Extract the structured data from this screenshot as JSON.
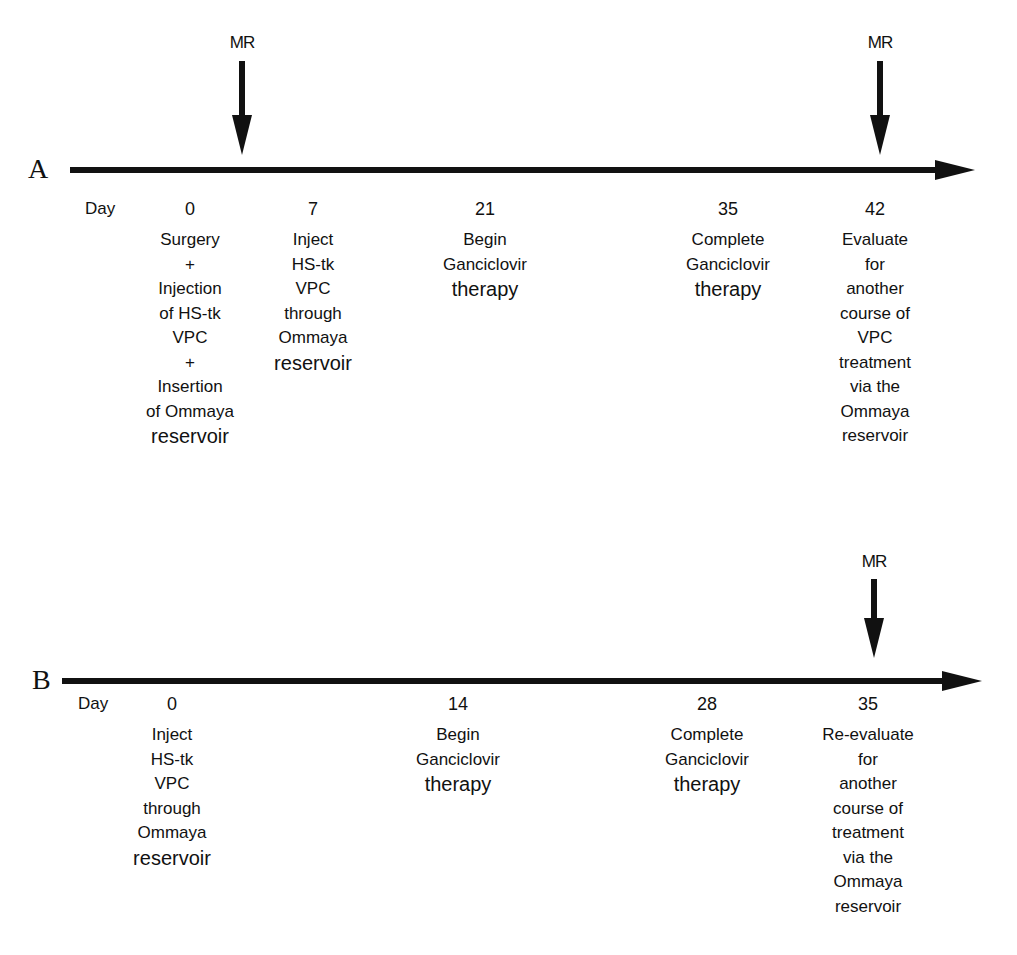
{
  "panels": {
    "a": {
      "letter": "A",
      "day_label": "Day",
      "mr_markers": [
        {
          "label": "MR",
          "position": "between day 0 and day 7"
        },
        {
          "label": "MR",
          "position": "day 42"
        }
      ],
      "events": [
        {
          "day": "0",
          "lines": [
            "Surgery",
            "+",
            "Injection",
            "of HS-tk",
            "VPC",
            "+",
            "Insertion",
            "of Ommaya",
            "reservoir"
          ]
        },
        {
          "day": "7",
          "lines": [
            "Inject",
            "HS-tk",
            "VPC",
            "through",
            "Ommaya",
            "reservoir"
          ]
        },
        {
          "day": "21",
          "lines": [
            "Begin",
            "Ganciclovir",
            "therapy"
          ]
        },
        {
          "day": "35",
          "lines": [
            "Complete",
            "Ganciclovir",
            "therapy"
          ]
        },
        {
          "day": "42",
          "lines": [
            "Evaluate",
            "for",
            "another",
            "course of",
            "VPC",
            "treatment",
            "via the",
            "Ommaya",
            "reservoir"
          ]
        }
      ]
    },
    "b": {
      "letter": "B",
      "day_label": "Day",
      "mr_markers": [
        {
          "label": "MR",
          "position": "day 35"
        }
      ],
      "events": [
        {
          "day": "0",
          "lines": [
            "Inject",
            "HS-tk",
            "VPC",
            "through",
            "Ommaya",
            "reservoir"
          ]
        },
        {
          "day": "14",
          "lines": [
            "Begin",
            "Ganciclovir",
            "therapy"
          ]
        },
        {
          "day": "28",
          "lines": [
            "Complete",
            "Ganciclovir",
            "therapy"
          ]
        },
        {
          "day": "35",
          "lines": [
            "Re-evaluate",
            "for",
            "another",
            "course of",
            "treatment",
            "via the",
            "Ommaya",
            "reservoir"
          ]
        }
      ]
    }
  },
  "colors": {
    "ink": "#111111",
    "background": "#ffffff"
  }
}
